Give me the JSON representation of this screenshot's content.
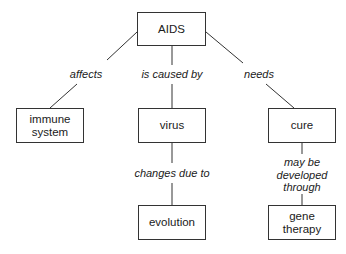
{
  "diagram": {
    "type": "concept-map",
    "nodes": {
      "aids": "AIDS",
      "immune": "immune system",
      "virus": "virus",
      "cure": "cure",
      "evolution": "evolution",
      "gene": "gene therapy"
    },
    "edges": {
      "affects": "affects",
      "caused_by": "is caused by",
      "needs": "needs",
      "changes": "changes due to",
      "may_be_1": "may be",
      "may_be_2": "developed",
      "may_be_3": "through"
    },
    "line_color": "#333333"
  }
}
